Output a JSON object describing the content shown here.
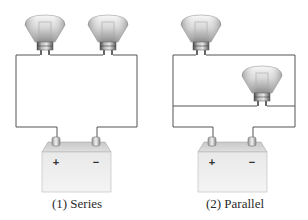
{
  "diagrams": [
    {
      "id": "series",
      "caption": "(1) Series",
      "bulb_count": 2,
      "battery": {
        "positive_label": "+",
        "negative_label": "−"
      }
    },
    {
      "id": "parallel",
      "caption": "(2) Parallel",
      "bulb_count": 2,
      "battery": {
        "positive_label": "+",
        "negative_label": "−"
      }
    }
  ],
  "colors": {
    "wire": "#555555",
    "battery_body": "#ececec",
    "battery_top": "#d4d4d4",
    "bulb_glass": "#d8d8d8",
    "bulb_base": "#9a9a9a",
    "text": "#2a2a2a"
  }
}
